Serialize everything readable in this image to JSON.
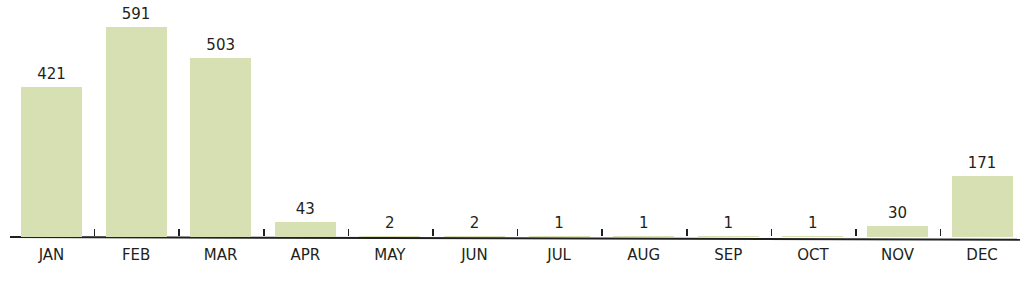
{
  "chart_data": {
    "type": "bar",
    "title": "",
    "xlabel": "",
    "ylabel": "",
    "categories": [
      "JAN",
      "FEB",
      "MAR",
      "APR",
      "MAY",
      "JUN",
      "JUL",
      "AUG",
      "SEP",
      "OCT",
      "NOV",
      "DEC"
    ],
    "values": [
      421,
      591,
      503,
      43,
      2,
      2,
      1,
      1,
      1,
      1,
      30,
      171
    ],
    "ylim": [
      0,
      600
    ],
    "grid": false,
    "legend": null,
    "data_labels": true,
    "bar_color": "#d6e0b3"
  },
  "labels": {
    "values": [
      "421",
      "591",
      "503",
      "43",
      "2",
      "2",
      "1",
      "1",
      "1",
      "1",
      "30",
      "171"
    ],
    "months": [
      "JAN",
      "FEB",
      "MAR",
      "APR",
      "MAY",
      "JUN",
      "JUL",
      "AUG",
      "SEP",
      "OCT",
      "NOV",
      "DEC"
    ]
  }
}
